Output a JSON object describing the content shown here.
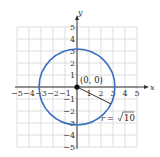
{
  "chart_data": {
    "type": "scatter",
    "title": "",
    "xlabel": "x",
    "ylabel": "y",
    "xlim": [
      -5,
      5
    ],
    "ylim": [
      -5,
      5
    ],
    "grid": true,
    "xticks": [
      "-5",
      "-4",
      "-3",
      "-2",
      "-1",
      "1",
      "2",
      "3",
      "4",
      "5"
    ],
    "yticks": [
      "5",
      "4",
      "3",
      "2",
      "1",
      "-1",
      "-2",
      "-3",
      "-4",
      "-5"
    ],
    "circle": {
      "center": [
        0,
        0
      ],
      "radius": 3.1623,
      "color": "#3a6fc4"
    },
    "center_point": {
      "x": 0,
      "y": 0,
      "label": "(0, 0)"
    },
    "radius_segment": {
      "from": [
        0,
        0
      ],
      "to": [
        2.83,
        -1.41
      ]
    },
    "annotation": {
      "prefix": "r = ",
      "radicand": "10"
    }
  }
}
